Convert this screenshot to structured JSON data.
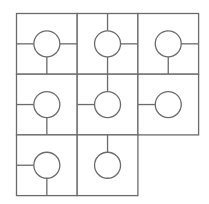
{
  "game": {
    "name": "circuit tile puzzle",
    "rows": 3,
    "cols": 3,
    "origin_x": 16.5,
    "origin_y": 13.5,
    "cell_size": 60.7,
    "circle_radius": 13,
    "line_color": "#6b6b6b",
    "background": "#ffffff",
    "cells": [
      {
        "row": 0,
        "col": 0,
        "present": true,
        "connections": [
          "left",
          "right",
          "bottom"
        ]
      },
      {
        "row": 0,
        "col": 1,
        "present": true,
        "connections": [
          "top",
          "right",
          "bottom"
        ]
      },
      {
        "row": 0,
        "col": 2,
        "present": true,
        "connections": [
          "right",
          "bottom"
        ]
      },
      {
        "row": 1,
        "col": 0,
        "present": true,
        "connections": [
          "left",
          "bottom"
        ]
      },
      {
        "row": 1,
        "col": 1,
        "present": true,
        "connections": [
          "top",
          "left"
        ]
      },
      {
        "row": 1,
        "col": 2,
        "present": true,
        "connections": [
          "left"
        ]
      },
      {
        "row": 2,
        "col": 0,
        "present": true,
        "connections": [
          "left",
          "bottom"
        ]
      },
      {
        "row": 2,
        "col": 1,
        "present": true,
        "connections": [
          "top"
        ]
      },
      {
        "row": 2,
        "col": 2,
        "present": false,
        "connections": []
      }
    ]
  }
}
